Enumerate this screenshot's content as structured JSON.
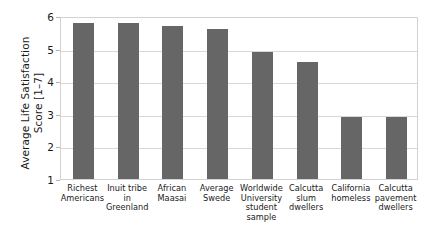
{
  "chart_data": {
    "type": "bar",
    "title": "",
    "xlabel": "",
    "ylabel": "Average Life Satisfaction\nScore [1–7]",
    "ylabel_line1": "Average Life Satisfaction",
    "ylabel_line2": "Score [1–7]",
    "ylim": [
      1,
      6
    ],
    "ytick_labels": [
      "1",
      "2",
      "3",
      "4",
      "5",
      "6"
    ],
    "ytick_values": [
      1,
      2,
      3,
      4,
      5,
      6
    ],
    "grid": true,
    "legend": false,
    "bar_color": "#666666",
    "categories": [
      "Richest\nAmericans",
      "Inuit tribe\nin\nGreenland",
      "African\nMaasai",
      "Average\nSwede",
      "Worldwide\nUniversity\nstudent\nsample",
      "Calcutta\nslum\ndwellers",
      "California\nhomeless",
      "Calcutta\npavement\ndwellers"
    ],
    "values": [
      5.8,
      5.8,
      5.7,
      5.6,
      4.9,
      4.6,
      2.9,
      2.9
    ]
  }
}
